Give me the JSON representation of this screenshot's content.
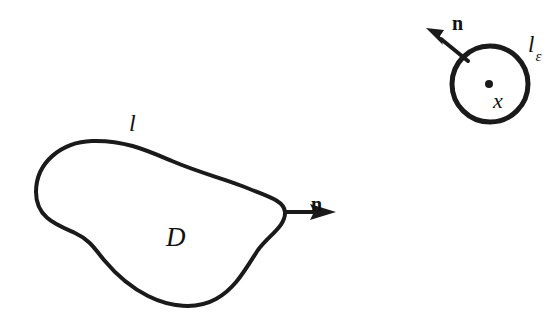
{
  "figure": {
    "background_color": "#ffffff",
    "ink_color": "#1a1a1a",
    "stroke_width": 4
  },
  "domain_region": {
    "boundary_label": "l",
    "boundary_label_x": 129,
    "boundary_label_y": 131,
    "boundary_label_size": 24,
    "interior_label": "D",
    "interior_label_x": 166,
    "interior_label_y": 246,
    "interior_label_size": 27,
    "normal_label": "n",
    "normal_label_x": 311,
    "normal_label_y": 211,
    "normal_label_size": 20,
    "outline_path": "M 36 192 C 36 162 62 142 92 141 C 124 140 146 150 172 161 C 200 173 222 178 242 186 C 266 196 284 200 285 212 C 286 226 268 236 258 250 C 246 268 236 288 216 299 C 196 310 170 307 148 296 C 128 286 114 272 104 260 C 95 249 90 240 75 233 C 57 225 36 218 36 192 Z",
    "normal_arrow_shaft": "M 285 212 L 316 212",
    "normal_arrow_head": "M 336 212 L 310 204 L 314 212 L 310 220 Z"
  },
  "epsilon_disk": {
    "center_x": 490,
    "center_y": 84,
    "radius": 38,
    "boundary_label": "l",
    "boundary_label_subscript": "ε",
    "boundary_label_x": 528,
    "boundary_label_y": 52,
    "boundary_label_size": 23,
    "subscript_size": 15,
    "point_label": "x",
    "point_label_x": 493,
    "point_label_y": 108,
    "point_label_size": 22,
    "point_dot_x": 489,
    "point_dot_y": 84,
    "point_dot_radius": 4,
    "normal_label": "n",
    "normal_label_x": 452,
    "normal_label_y": 30,
    "normal_label_size": 20,
    "normal_arrow_shaft": "M 468 61 L 441 39",
    "normal_arrow_head": "M 426 28 L 444 30 L 440 36 L 443 45 Z"
  }
}
